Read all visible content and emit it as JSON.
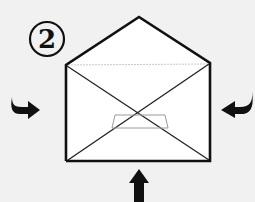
{
  "diagram": {
    "step_number": "2",
    "colors": {
      "background": "#f1f1f1",
      "envelope_fill": "#ffffff",
      "line": "#111111",
      "fold_guide": "#9a9a9a",
      "arrow": "#111111"
    },
    "envelope": {
      "corners": {
        "top_left": [
          66,
          65
        ],
        "peak": [
          139,
          17
        ],
        "top_right": [
          210,
          63
        ],
        "bottom_right": [
          209,
          160
        ],
        "bottom_left": [
          67,
          161
        ]
      },
      "center_box": {
        "x": 113,
        "y": 115,
        "w": 54,
        "h": 13
      }
    },
    "arrows": [
      {
        "name": "left-arrow",
        "direction": "right",
        "position": [
          20,
          107
        ]
      },
      {
        "name": "right-arrow",
        "direction": "left",
        "position": [
          235,
          107
        ]
      },
      {
        "name": "bottom-arrow",
        "direction": "up",
        "position": [
          139,
          185
        ]
      }
    ]
  }
}
